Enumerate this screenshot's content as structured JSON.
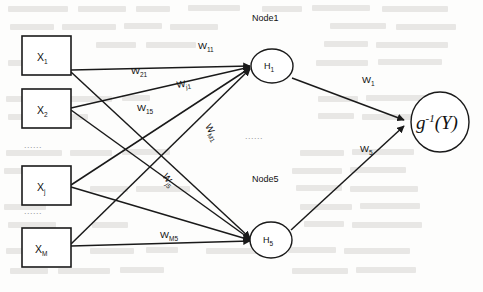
{
  "figure": {
    "type": "neural-network-diagram"
  },
  "input_layer": {
    "nodes": [
      {
        "id": "x1",
        "label": "X",
        "sub": "1"
      },
      {
        "id": "x2",
        "label": "X",
        "sub": "2"
      },
      {
        "id": "xj",
        "label": "X",
        "sub": "j"
      },
      {
        "id": "xM",
        "label": "X",
        "sub": "M"
      }
    ],
    "ellipsis_upper": "......",
    "ellipsis_lower": "......"
  },
  "hidden_layer": {
    "group_label_top": "Node1",
    "group_label_bottom": "Node5",
    "ellipsis": "......",
    "nodes": [
      {
        "id": "h1",
        "label": "H",
        "sub": "1"
      },
      {
        "id": "h5",
        "label": "H",
        "sub": "5"
      }
    ]
  },
  "output_layer": {
    "node": {
      "id": "out",
      "glyph": "g",
      "superscript": "-1",
      "argument": "(Y)"
    }
  },
  "weights": {
    "input_to_hidden": [
      {
        "id": "w11",
        "label": "W",
        "sub": "11"
      },
      {
        "id": "w21",
        "label": "W",
        "sub": "21"
      },
      {
        "id": "wj1",
        "label": "W",
        "sub": "j1"
      },
      {
        "id": "w15",
        "label": "W",
        "sub": "15"
      },
      {
        "id": "wM1",
        "label": "W",
        "sub": "M1"
      },
      {
        "id": "wj5",
        "label": "W",
        "sub": "j5"
      },
      {
        "id": "wM5",
        "label": "W",
        "sub": "M5"
      }
    ],
    "hidden_to_output": [
      {
        "id": "w1",
        "label": "W",
        "sub": "1"
      },
      {
        "id": "w5",
        "label": "W",
        "sub": "5"
      }
    ]
  },
  "colors": {
    "ink": "#1a1a1a",
    "page": "#fdfdfc",
    "bleed": "#c9c6c2",
    "ellipsis": "#9a9a9a"
  }
}
